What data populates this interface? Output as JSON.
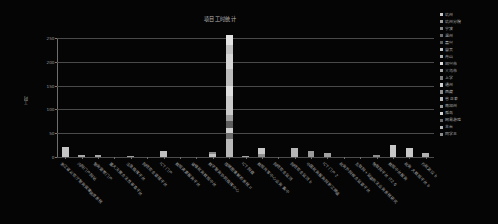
{
  "chart_data": {
    "type": "bar",
    "title": "项目工时统计",
    "xlabel": "",
    "ylabel": "工时",
    "ylim": [
      0,
      250
    ],
    "yticks": [
      0,
      50,
      100,
      150,
      200,
      250
    ],
    "grid": "horizontal",
    "legend_position": "right",
    "stacked": true,
    "categories": [
      "浙江省公安厅警务保障信息系统",
      "内网门户网站",
      "警务督察门户",
      "重大决策合法性审查平台",
      "应急指挥平台",
      "网络安全管理平台",
      "ICT 门户",
      "数据资源服务平台",
      "省级政务数据中台",
      "数字警务协同指挥中心",
      "视频图像解析系统 II",
      "ICT 网盘",
      "数据共享中心业务 集中",
      "网络安全监测",
      "政务 大数据平台",
      "中国政务服务网浙江频道",
      "ICT 门户 2",
      "政务外网综合监管平台",
      "互联网+监管执法业务系统研究",
      "物联网平台 IT2.0",
      "数据中台服务",
      "行政复议",
      "办公、综合、行政管理"
    ],
    "series": [
      {
        "name": "杭州",
        "color": "#c9c9c9",
        "values": [
          22,
          4,
          5,
          0,
          3,
          0,
          12,
          0,
          0,
          10,
          28,
          0,
          0,
          0,
          0,
          0,
          0,
          0,
          0,
          0,
          0,
          0,
          0
        ]
      },
      {
        "name": "杭州分院",
        "color": "#9e9e9e",
        "values": [
          0,
          0,
          0,
          0,
          0,
          0,
          0,
          0,
          0,
          0,
          58,
          0,
          0,
          0,
          0,
          0,
          0,
          0,
          0,
          0,
          0,
          0,
          0
        ]
      },
      {
        "name": "宁波",
        "color": "#8a8a8a",
        "values": [
          0,
          0,
          0,
          0,
          0,
          0,
          0,
          0,
          0,
          0,
          25,
          0,
          0,
          0,
          0,
          0,
          0,
          0,
          0,
          0,
          0,
          0,
          0
        ]
      },
      {
        "name": "温州",
        "color": "#6f6f6f",
        "values": [
          0,
          0,
          0,
          0,
          0,
          0,
          0,
          0,
          0,
          0,
          18,
          0,
          0,
          0,
          0,
          0,
          0,
          0,
          0,
          0,
          0,
          0,
          0
        ]
      },
      {
        "name": "嘉兴",
        "color": "#5a5a5a",
        "values": [
          0,
          0,
          0,
          0,
          0,
          0,
          0,
          0,
          0,
          0,
          30,
          0,
          0,
          0,
          0,
          0,
          0,
          0,
          0,
          0,
          0,
          0,
          0
        ]
      },
      {
        "name": "自贡",
        "color": "#c4c4c4",
        "values": [
          0,
          0,
          0,
          0,
          0,
          0,
          0,
          0,
          0,
          0,
          45,
          0,
          0,
          0,
          0,
          0,
          0,
          0,
          0,
          0,
          0,
          0,
          0
        ]
      },
      {
        "name": "舟山",
        "color": "#b0b0b0",
        "values": [
          0,
          0,
          0,
          0,
          0,
          0,
          0,
          0,
          0,
          0,
          22,
          0,
          0,
          0,
          0,
          0,
          0,
          0,
          0,
          0,
          0,
          0,
          0
        ]
      },
      {
        "name": "绍兴市",
        "color": "#dcdcdc",
        "values": [
          0,
          0,
          0,
          0,
          0,
          0,
          0,
          0,
          0,
          0,
          30,
          0,
          0,
          0,
          0,
          0,
          0,
          0,
          0,
          0,
          0,
          0,
          0
        ]
      },
      {
        "name": "义乌市",
        "color": "#a6a6a6",
        "values": [
          0,
          0,
          0,
          0,
          0,
          0,
          0,
          0,
          0,
          0,
          0,
          0,
          0,
          0,
          0,
          0,
          0,
          0,
          0,
          0,
          0,
          0,
          0
        ]
      },
      {
        "name": "上学",
        "color": "#7d7d7d",
        "values": [
          0,
          0,
          0,
          0,
          0,
          0,
          0,
          0,
          0,
          0,
          0,
          0,
          0,
          0,
          0,
          0,
          0,
          0,
          0,
          0,
          0,
          0,
          0
        ]
      },
      {
        "name": "通州",
        "color": "#cfcfcf",
        "values": [
          0,
          0,
          0,
          0,
          0,
          0,
          0,
          0,
          0,
          0,
          0,
          0,
          0,
          0,
          0,
          0,
          0,
          0,
          0,
          0,
          0,
          0,
          0
        ]
      },
      {
        "name": "西藏",
        "color": "#8f8f8f",
        "values": [
          0,
          0,
          0,
          0,
          0,
          0,
          0,
          0,
          0,
          0,
          0,
          0,
          0,
          0,
          0,
          0,
          0,
          0,
          0,
          0,
          0,
          0,
          0
        ]
      },
      {
        "name": "省 正泰",
        "color": "#bdbdbd",
        "values": [
          0,
          0,
          0,
          0,
          0,
          0,
          0,
          0,
          0,
          0,
          0,
          0,
          0,
          0,
          0,
          0,
          0,
          0,
          0,
          0,
          0,
          0,
          0
        ]
      },
      {
        "name": "南加州",
        "color": "#9a9a9a",
        "values": [
          0,
          0,
          0,
          0,
          0,
          0,
          0,
          0,
          0,
          0,
          0,
          0,
          0,
          0,
          0,
          0,
          0,
          0,
          0,
          0,
          0,
          0,
          0
        ]
      },
      {
        "name": "孤岛",
        "color": "#d4d4d4",
        "values": [
          0,
          0,
          0,
          0,
          0,
          0,
          0,
          0,
          0,
          0,
          0,
          0,
          0,
          0,
          0,
          0,
          0,
          0,
          0,
          0,
          0,
          0,
          0
        ]
      },
      {
        "name": "网易游戏",
        "color": "#6a6a6a",
        "values": [
          0,
          0,
          0,
          0,
          0,
          0,
          0,
          0,
          0,
          0,
          0,
          0,
          0,
          0,
          0,
          0,
          0,
          0,
          0,
          0,
          0,
          0,
          0
        ]
      },
      {
        "name": "丰台",
        "color": "#b8b8b8",
        "values": [
          0,
          0,
          0,
          0,
          0,
          0,
          0,
          0,
          0,
          0,
          0,
          0,
          0,
          0,
          0,
          0,
          0,
          0,
          0,
          0,
          0,
          0,
          0
        ]
      },
      {
        "name": "同学王",
        "color": "#8d8d8d",
        "values": [
          0,
          0,
          0,
          0,
          0,
          0,
          0,
          0,
          0,
          0,
          0,
          0,
          0,
          0,
          0,
          0,
          0,
          0,
          0,
          0,
          0,
          0,
          0
        ]
      }
    ],
    "totals": [
      22,
      4,
      5,
      0,
      3,
      0,
      12,
      0,
      0,
      10,
      256,
      3,
      18,
      0,
      0,
      13,
      9,
      0,
      0,
      4,
      25,
      0,
      0
    ]
  },
  "bars": [
    {
      "label": "浙江省公安厅警务保障信息系统",
      "total": 22,
      "segments": [
        {
          "h": 22,
          "color": "#c5c5c5"
        }
      ]
    },
    {
      "label": "内网门户网站",
      "total": 4,
      "segments": [
        {
          "h": 4,
          "color": "#a8a8a8"
        }
      ]
    },
    {
      "label": "警务督察门户",
      "total": 5,
      "segments": [
        {
          "h": 5,
          "color": "#a8a8a8"
        }
      ]
    },
    {
      "label": "重大决策合法性审查平台",
      "total": 0,
      "segments": []
    },
    {
      "label": "应急指挥平台",
      "total": 3,
      "segments": [
        {
          "h": 3,
          "color": "#a0a0a0"
        }
      ]
    },
    {
      "label": "网络安全管理平台",
      "total": 0,
      "segments": []
    },
    {
      "label": "ICT 门户",
      "total": 12,
      "segments": [
        {
          "h": 12,
          "color": "#c0c0c0"
        }
      ]
    },
    {
      "label": "数据资源服务平台",
      "total": 0,
      "segments": []
    },
    {
      "label": "省级政务数据中台",
      "total": 0,
      "segments": []
    },
    {
      "label": "数字警务协同指挥中心",
      "total": 10,
      "segments": [
        {
          "h": 7,
          "color": "#c2c2c2"
        },
        {
          "h": 3,
          "color": "#8a8a8a"
        }
      ]
    },
    {
      "label": "视频图像解析系统 II",
      "total": 256,
      "segments": [
        {
          "h": 38,
          "color": "#b9b9b9"
        },
        {
          "h": 12,
          "color": "#6e6e6e"
        },
        {
          "h": 10,
          "color": "#d0d0d0"
        },
        {
          "h": 16,
          "color": "#5d5d5d"
        },
        {
          "h": 12,
          "color": "#9d9d9d"
        },
        {
          "h": 40,
          "color": "#cacaca"
        },
        {
          "h": 22,
          "color": "#dedede"
        },
        {
          "h": 36,
          "color": "#bcbcbc"
        },
        {
          "h": 30,
          "color": "#d6d6d6"
        },
        {
          "h": 20,
          "color": "#c3c3c3"
        },
        {
          "h": 20,
          "color": "#e2e2e2"
        }
      ]
    },
    {
      "label": "ICT 网盘",
      "total": 3,
      "segments": [
        {
          "h": 3,
          "color": "#a5a5a5"
        }
      ]
    },
    {
      "label": "数据共享中心业务 集中",
      "total": 18,
      "segments": [
        {
          "h": 6,
          "color": "#8e8e8e"
        },
        {
          "h": 12,
          "color": "#c8c8c8"
        }
      ]
    },
    {
      "label": "网络安全监测",
      "total": 0,
      "segments": []
    },
    {
      "label": "政务 大数据平台",
      "total": 0,
      "segments": []
    },
    {
      "label": "中国政务服务网浙江频道",
      "total": 13,
      "segments": [
        {
          "h": 13,
          "color": "#9b9b9b"
        }
      ]
    },
    {
      "label": "ICT 门户 2",
      "total": 9,
      "segments": [
        {
          "h": 9,
          "color": "#a1a1a1"
        }
      ]
    },
    {
      "label": "政务外网综合监管平台",
      "total": 0,
      "segments": []
    },
    {
      "label": "互联网+监管执法业务系统研究",
      "total": 0,
      "segments": []
    },
    {
      "label": "物联网平台 IT2.0",
      "total": 4,
      "segments": [
        {
          "h": 4,
          "color": "#8c8c8c"
        }
      ]
    },
    {
      "label": "数据中台服务",
      "total": 25,
      "segments": [
        {
          "h": 25,
          "color": "#c7c7c7"
        }
      ]
    },
    {
      "label": "行政复议",
      "total": 0,
      "segments": []
    },
    {
      "label": "办公、综合、行政管理",
      "total": 0,
      "segments": []
    }
  ],
  "extra_bars": [
    {
      "label": "网络安全监测 b",
      "total": 18,
      "segments": [
        {
          "h": 18,
          "color": "#b5b5b5"
        }
      ]
    },
    {
      "label": "政务 大数据平台 b",
      "total": 19,
      "segments": [
        {
          "h": 19,
          "color": "#c9c9c9"
        }
      ]
    },
    {
      "label": "行政复议 b",
      "total": 8,
      "segments": [
        {
          "h": 8,
          "color": "#b0b0b0"
        }
      ]
    }
  ],
  "axes": {
    "y_title": "工时",
    "y_ticks": [
      "250",
      "200",
      "150",
      "100",
      "50",
      "0"
    ]
  },
  "legend": {
    "items": [
      {
        "label": "杭州",
        "color": "#c9c9c9"
      },
      {
        "label": "杭州分院",
        "color": "#9e9e9e"
      },
      {
        "label": "宁波",
        "color": "#8a8a8a"
      },
      {
        "label": "温州",
        "color": "#6f6f6f"
      },
      {
        "label": "嘉兴",
        "color": "#5a5a5a"
      },
      {
        "label": "自贡",
        "color": "#c4c4c4"
      },
      {
        "label": "舟山",
        "color": "#b0b0b0"
      },
      {
        "label": "绍兴市",
        "color": "#dcdcdc"
      },
      {
        "label": "义乌市",
        "color": "#a6a6a6"
      },
      {
        "label": "上学",
        "color": "#7d7d7d"
      },
      {
        "label": "通州",
        "color": "#cfcfcf"
      },
      {
        "label": "西藏",
        "color": "#8f8f8f"
      },
      {
        "label": "省 正泰",
        "color": "#bdbdbd"
      },
      {
        "label": "南加州",
        "color": "#9a9a9a"
      },
      {
        "label": "孤岛",
        "color": "#d4d4d4"
      },
      {
        "label": "网易游戏",
        "color": "#6a6a6a"
      },
      {
        "label": "丰台",
        "color": "#b8b8b8"
      },
      {
        "label": "同学王",
        "color": "#8d8d8d"
      }
    ]
  }
}
